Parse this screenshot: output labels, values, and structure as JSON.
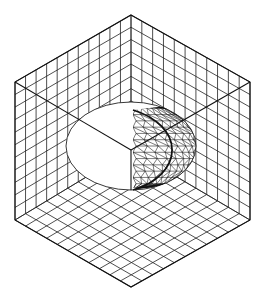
{
  "figure": {
    "canvas": {
      "width": 263,
      "height": 301,
      "background": "#ffffff"
    },
    "colors": {
      "line": "#222222",
      "edge": "#111111",
      "fill": "#ffffff"
    },
    "cube": {
      "divisions": 11,
      "vertices": {
        "top": [
          131,
          15
        ],
        "left_top": [
          15,
          82
        ],
        "right_top": [
          250,
          82
        ],
        "center": [
          131,
          150
        ],
        "left_bottom": [
          15,
          220
        ],
        "right_bottom": [
          250,
          220
        ],
        "bottom": [
          131,
          287
        ]
      },
      "faces": [
        "back-left-wall",
        "back-right-wall",
        "floor"
      ]
    },
    "ellipse": {
      "cx": 131,
      "cy": 146,
      "rx": 65,
      "ry": 44,
      "fill": "#ffffff"
    },
    "sphere_mesh": {
      "x_start": 133,
      "cx": 131,
      "cy": 146,
      "rx": 67,
      "ry": 44,
      "rows": 14,
      "cols": 9
    },
    "center_axes": true
  }
}
